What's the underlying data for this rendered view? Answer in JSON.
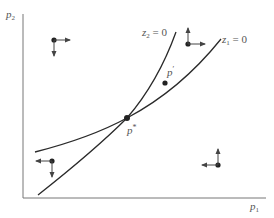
{
  "figure": {
    "axes": {
      "x_label": "p",
      "x_label_sub": "1",
      "y_label": "p",
      "y_label_sub": "2"
    },
    "curves": [
      {
        "id": "z2",
        "label": "z",
        "label_sub": "2",
        "label_rest": " = 0"
      },
      {
        "id": "z1",
        "label": "z",
        "label_sub": "1",
        "label_rest": " = 0"
      }
    ],
    "points": [
      {
        "id": "p_star",
        "label": "p",
        "label_sup": "*"
      },
      {
        "id": "p_prime",
        "label": "p",
        "label_sup": "′"
      }
    ],
    "direction_markers": [
      {
        "region": "top-left",
        "horizontal": "right",
        "vertical": "down"
      },
      {
        "region": "top-right",
        "horizontal": "right",
        "vertical": "up"
      },
      {
        "region": "bottom-left",
        "horizontal": "left",
        "vertical": "down"
      },
      {
        "region": "bottom-right",
        "horizontal": "left",
        "vertical": "up"
      }
    ],
    "colors": {
      "curve": "#2a2a2a",
      "axis": "#777777",
      "arrow": "#444444",
      "label": "#555555"
    }
  }
}
